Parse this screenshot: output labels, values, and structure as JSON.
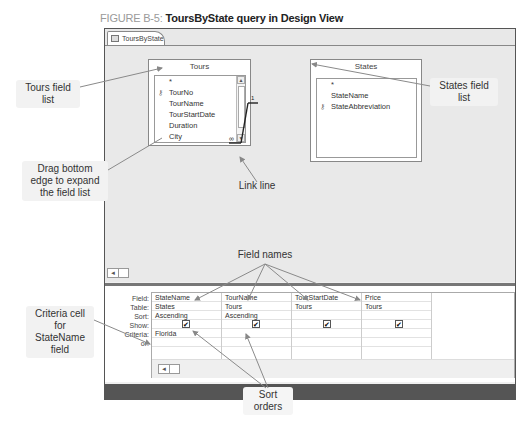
{
  "figure": {
    "number": "FIGURE B-5:",
    "title": "ToursByState query in Design View"
  },
  "window": {
    "tab_label": "ToursByState"
  },
  "field_lists": {
    "tours": {
      "title": "Tours",
      "items": [
        "*",
        "TourNo",
        "TourName",
        "TourStartDate",
        "Duration",
        "City"
      ],
      "key_field": "TourNo"
    },
    "states": {
      "title": "States",
      "items": [
        "*",
        "StateName",
        "StateAbbreviation"
      ],
      "key_field": "StateAbbreviation"
    }
  },
  "relationship": {
    "one_side": "1",
    "many_side": "∞"
  },
  "design_grid": {
    "row_labels": [
      "Field:",
      "Table:",
      "Sort:",
      "Show:",
      "Criteria:",
      "or:"
    ],
    "columns": [
      {
        "field": "StateName",
        "table": "States",
        "sort": "Ascending",
        "show": true,
        "criteria": "Florida",
        "or": ""
      },
      {
        "field": "TourName",
        "table": "Tours",
        "sort": "Ascending",
        "show": true,
        "criteria": "",
        "or": ""
      },
      {
        "field": "TourStartDate",
        "table": "Tours",
        "sort": "",
        "show": true,
        "criteria": "",
        "or": ""
      },
      {
        "field": "Price",
        "table": "Tours",
        "sort": "",
        "show": true,
        "criteria": "",
        "or": ""
      }
    ]
  },
  "callouts": {
    "tours_field_list": "Tours field list",
    "states_field_list": "States field list",
    "drag_bottom_edge": "Drag bottom edge to expand the field list",
    "link_line": "Link line",
    "field_names": "Field names",
    "criteria_cell": "Criteria cell for StateName field",
    "sort_orders": "Sort orders"
  },
  "icons": {
    "checkbox_checked": "✔",
    "key": "key-icon",
    "scroll_up": "▲",
    "scroll_down": "▼",
    "scroll_left": "◄"
  }
}
